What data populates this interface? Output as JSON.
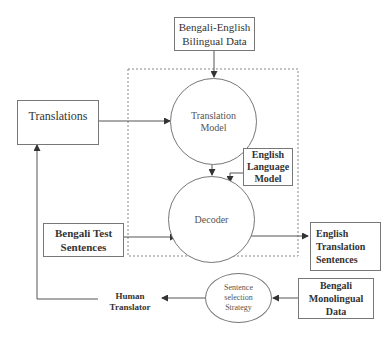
{
  "diagram": {
    "nodes": {
      "bilingual_data": {
        "label": "Bengali-English\nBilingual Data",
        "shape": "rectangle"
      },
      "translations": {
        "label": "Translations",
        "shape": "rectangle"
      },
      "translation_model": {
        "label": "Translation\nModel",
        "shape": "circle"
      },
      "english_lm": {
        "label": "English\nLanguage\nModel",
        "shape": "rectangle"
      },
      "decoder": {
        "label": "Decoder",
        "shape": "circle"
      },
      "bengali_test": {
        "label": "Bengali Test\nSentences",
        "shape": "rectangle"
      },
      "english_translation": {
        "label": "English\nTranslation\nSentences",
        "shape": "rectangle"
      },
      "sentence_selection": {
        "label": "Sentence\nselection\nStrategy",
        "shape": "ellipse"
      },
      "bengali_mono": {
        "label": "Bengali\nMonolingual\nData",
        "shape": "rectangle"
      },
      "human_translator": {
        "label": "Human\nTranslator",
        "shape": "text"
      }
    },
    "edges": [
      {
        "from": "bilingual_data",
        "to": "translation_model"
      },
      {
        "from": "translations",
        "to": "translation_model"
      },
      {
        "from": "translation_model",
        "to": "decoder"
      },
      {
        "from": "english_lm",
        "to": "decoder"
      },
      {
        "from": "bengali_test",
        "to": "decoder"
      },
      {
        "from": "decoder",
        "to": "english_translation"
      },
      {
        "from": "bengali_mono",
        "to": "sentence_selection"
      },
      {
        "from": "sentence_selection",
        "to": "human_translator"
      },
      {
        "from": "human_translator",
        "to": "translations"
      }
    ],
    "group": {
      "style": "dashed",
      "contains": [
        "translation_model",
        "english_lm",
        "decoder"
      ]
    },
    "colors": {
      "line": "#555555",
      "border": "#777777",
      "text": "#333333"
    }
  }
}
